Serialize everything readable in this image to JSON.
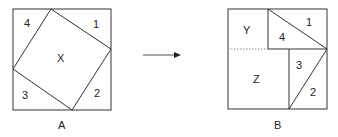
{
  "figure_a": {
    "caption": "A",
    "regions": {
      "x": "X",
      "r1": "1",
      "r2": "2",
      "r3": "3",
      "r4": "4"
    }
  },
  "figure_b": {
    "caption": "B",
    "regions": {
      "y": "Y",
      "z": "Z",
      "r1": "1",
      "r2": "2",
      "r3": "3",
      "r4": "4"
    }
  },
  "arrow": {
    "direction": "right"
  },
  "colors": {
    "stroke": "#333333",
    "arrow": "#444444"
  }
}
